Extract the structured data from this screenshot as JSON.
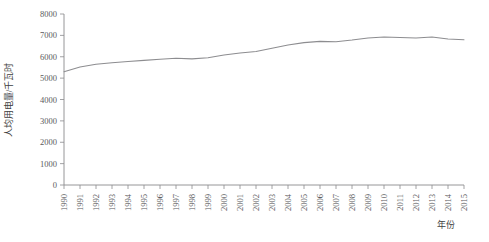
{
  "chart_data": {
    "type": "line",
    "title": "",
    "xlabel": "年份",
    "ylabel": "人均用电量/千瓦时",
    "categories": [
      "1990",
      "1991",
      "1992",
      "1993",
      "1994",
      "1995",
      "1996",
      "1997",
      "1998",
      "1999",
      "2000",
      "2001",
      "2002",
      "2003",
      "2004",
      "2005",
      "2006",
      "2007",
      "2008",
      "2009",
      "2010",
      "2011",
      "2012",
      "2013",
      "2014",
      "2015"
    ],
    "values": [
      5300,
      5520,
      5650,
      5720,
      5780,
      5830,
      5880,
      5930,
      5900,
      5950,
      6080,
      6180,
      6250,
      6400,
      6550,
      6660,
      6720,
      6700,
      6780,
      6880,
      6920,
      6900,
      6880,
      6920,
      6830,
      6800
    ],
    "series": [
      {
        "name": "人均用电量",
        "values": [
          5300,
          5520,
          5650,
          5720,
          5780,
          5830,
          5880,
          5930,
          5900,
          5950,
          6080,
          6180,
          6250,
          6400,
          6550,
          6660,
          6720,
          6700,
          6780,
          6880,
          6920,
          6900,
          6880,
          6920,
          6830,
          6800
        ]
      }
    ],
    "xlim": [
      1990,
      2015
    ],
    "ylim": [
      0,
      8000
    ],
    "ytick_values": [
      0,
      1000,
      2000,
      3000,
      4000,
      5000,
      6000,
      7000,
      8000
    ],
    "ytick_labels": [
      "0",
      "1000",
      "2000",
      "3000",
      "4000",
      "5000",
      "6000",
      "7000",
      "8000"
    ],
    "xtick_labels": [
      "1990",
      "1991",
      "1992",
      "1993",
      "1994",
      "1995",
      "1996",
      "1997",
      "1998",
      "1999",
      "2000",
      "2001",
      "2002",
      "2003",
      "2004",
      "2005",
      "2006",
      "2007",
      "2008",
      "2009",
      "2010",
      "2011",
      "2012",
      "2013",
      "2014",
      "2015"
    ],
    "grid": false,
    "legend": false,
    "line_color": "#8d8d90",
    "axis_color": "#8a8a8d",
    "text_color": "#59595c",
    "background": "#ffffff",
    "xtick_rotation": -90
  }
}
